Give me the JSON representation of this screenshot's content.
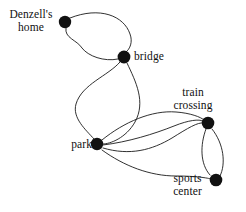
{
  "diagram": {
    "type": "undirected-multigraph",
    "title": "",
    "background_color": "#ffffff",
    "vertex_color": "#111111",
    "edge_color": "#1a1a1a",
    "nodes": [
      {
        "id": "denzell",
        "label": "Denzell's\nhome",
        "label_line1": "Denzell's",
        "label_line2": "home",
        "x": 65,
        "y": 22,
        "r": 6.2
      },
      {
        "id": "bridge",
        "label": "bridge",
        "label_line1": "bridge",
        "label_line2": "",
        "x": 124,
        "y": 57,
        "r": 6.4
      },
      {
        "id": "park",
        "label": "park",
        "label_line1": "park",
        "label_line2": "",
        "x": 97,
        "y": 144,
        "r": 6.2
      },
      {
        "id": "train",
        "label": "train\ncrossing",
        "label_line1": "train",
        "label_line2": "crossing",
        "x": 208,
        "y": 123,
        "r": 6.3
      },
      {
        "id": "sports",
        "label": "sports\ncenter",
        "label_line1": "sports",
        "label_line2": "center",
        "x": 216,
        "y": 180,
        "r": 6.3
      }
    ],
    "edges": [
      {
        "from": "denzell",
        "to": "bridge",
        "multiplicity_index": 1,
        "path": "M 70 18 C 100 6 124 16 130 34 C 133 42 130 49 126 52"
      },
      {
        "from": "denzell",
        "to": "bridge",
        "multiplicity_index": 2,
        "path": "M 66 28 C 64 38 77 40 82 48 C 88 56 104 62 118 59"
      },
      {
        "from": "bridge",
        "to": "park",
        "multiplicity_index": 1,
        "path": "M 120 62 C 108 76 82 84 76 104 C 72 118 86 130 94 139"
      },
      {
        "from": "bridge",
        "to": "park",
        "multiplicity_index": 2,
        "path": "M 127 63 C 136 82 146 102 135 122 C 126 138 110 144 103 144"
      },
      {
        "from": "park",
        "to": "train",
        "multiplicity_index": 1,
        "path": "M 102 140 C 124 122 152 110 176 112 C 190 113 201 117 204 120"
      },
      {
        "from": "park",
        "to": "train",
        "multiplicity_index": 2,
        "path": "M 103 145 C 128 142 154 134 174 126 C 189 120 199 119 203 121"
      },
      {
        "from": "park",
        "to": "train",
        "multiplicity_index": 3,
        "path": "M 103 148 C 130 156 152 150 172 138 C 188 128 198 122 203 123"
      },
      {
        "from": "park",
        "to": "sports",
        "multiplicity_index": 1,
        "path": "M 102 150 C 124 166 150 176 176 176 C 196 176 208 178 211 179"
      },
      {
        "from": "train",
        "to": "sports",
        "multiplicity_index": 1,
        "path": "M 206 129 C 200 145 200 164 210 175"
      },
      {
        "from": "train",
        "to": "sports",
        "multiplicity_index": 2,
        "path": "M 212 129 C 224 144 226 164 220 176"
      }
    ],
    "edge_counts": {
      "denzell-bridge": 2,
      "bridge-park": 2,
      "park-train": 3,
      "park-sports": 1,
      "train-sports": 2
    }
  }
}
